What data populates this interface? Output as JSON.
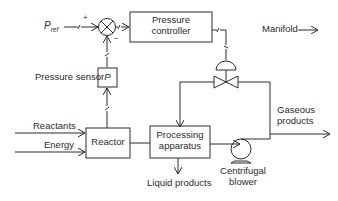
{
  "diagram": {
    "type": "process-control-block-diagram",
    "colors": {
      "line": "#2a2a2a",
      "background": "#ffffff"
    },
    "nodes": {
      "pref": {
        "label": "P",
        "subscript": "ref"
      },
      "summing_junction": {
        "plus": "+",
        "minus": "−"
      },
      "pressure_controller": {
        "line1": "Pressure",
        "line2": "controller"
      },
      "pressure_sensor": {
        "label": "Pressure sensor",
        "symbol": "P"
      },
      "reactor": {
        "label": "Reactor"
      },
      "processing_apparatus": {
        "line1": "Processing",
        "line2": "apparatus"
      },
      "centrifugal_blower": {
        "line1": "Centrifugal",
        "line2": "blower"
      },
      "control_valve": {
        "label": ""
      },
      "manifold": {
        "label": "Manifold"
      }
    },
    "inputs": {
      "reactants": "Reactants",
      "energy": "Energy"
    },
    "outputs": {
      "gaseous_line1": "Gaseous",
      "gaseous_line2": "products",
      "liquid": "Liquid products"
    }
  }
}
